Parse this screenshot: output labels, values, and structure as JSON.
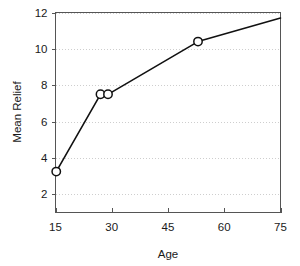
{
  "chart_data": {
    "type": "line",
    "title": "",
    "xlabel": "Age",
    "ylabel": "Mean Relief",
    "xlim": [
      15,
      75
    ],
    "ylim": [
      1,
      12
    ],
    "grid": "horizontal-dotted",
    "legend": "none",
    "x_ticks": [
      15,
      30,
      45,
      60,
      75
    ],
    "x_tick_labels": [
      "15",
      "30",
      "45",
      "60",
      "75"
    ],
    "y_ticks": [
      2,
      4,
      6,
      8,
      10,
      12
    ],
    "y_tick_labels": [
      "2",
      "4",
      "6",
      "8",
      "10",
      "12"
    ],
    "series": [
      {
        "name": "Mean Relief",
        "marker": "open-circle",
        "color": "#111111",
        "x": [
          15.2,
          27.0,
          29.0,
          53.0,
          75.0
        ],
        "y": [
          3.25,
          7.5,
          7.5,
          10.4,
          11.7
        ],
        "marked_points": [
          {
            "x": 15.2,
            "y": 3.25
          },
          {
            "x": 27.0,
            "y": 7.5
          },
          {
            "x": 29.0,
            "y": 7.5
          },
          {
            "x": 53.0,
            "y": 10.4
          }
        ]
      }
    ]
  },
  "axes": {
    "x_title": "Age",
    "y_title": "Mean Relief"
  },
  "colors": {
    "line": "#111111",
    "marker_fill": "#ffffff",
    "grid": "#c9c9c9",
    "frame": "#555555",
    "text": "#1a1a1a",
    "background": "#ffffff"
  }
}
